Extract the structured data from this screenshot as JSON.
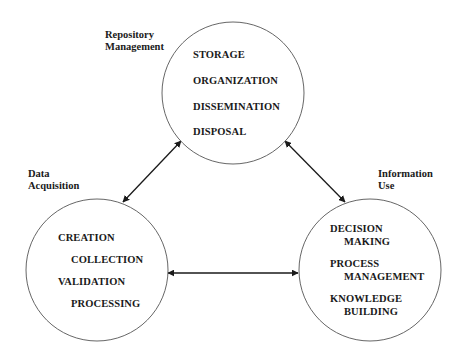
{
  "diagram": {
    "type": "cycle",
    "nodes": [
      {
        "id": "repository",
        "title_lines": [
          "Repository",
          "Management"
        ],
        "items": [
          "STORAGE",
          "ORGANIZATION",
          "DISSEMINATION",
          "DISPOSAL"
        ]
      },
      {
        "id": "acquisition",
        "title_lines": [
          "Data",
          "Acquisition"
        ],
        "items": [
          "CREATION",
          "COLLECTION",
          "VALIDATION",
          "PROCESSING"
        ]
      },
      {
        "id": "use",
        "title_lines": [
          "Information",
          "Use"
        ],
        "items": [
          "DECISION",
          "MAKING",
          "PROCESS",
          "MANAGEMENT",
          "KNOWLEDGE",
          "BUILDING"
        ]
      }
    ],
    "edges": [
      {
        "from": "acquisition",
        "to": "repository",
        "bidirectional": true
      },
      {
        "from": "repository",
        "to": "use",
        "bidirectional": true
      },
      {
        "from": "acquisition",
        "to": "use",
        "bidirectional": true
      }
    ],
    "colors": {
      "stroke": "#555555",
      "arrow": "#1a1a1a",
      "text": "#1a1a1a"
    }
  }
}
